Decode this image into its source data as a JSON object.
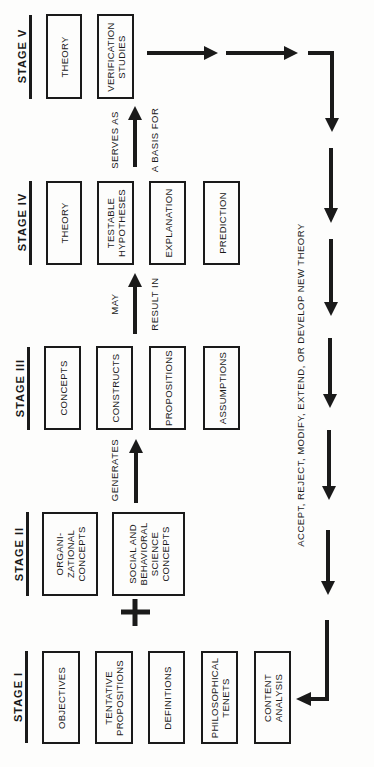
{
  "diagram": {
    "stages": [
      {
        "label": "STAGE V",
        "boxes": [
          "THEORY",
          "VERIFICATION\nSTUDIES"
        ]
      },
      {
        "label": "STAGE IV",
        "boxes": [
          "THEORY",
          "TESTABLE\nHYPOTHESES",
          "EXPLANATION",
          "PREDICTION"
        ]
      },
      {
        "label": "STAGE III",
        "boxes": [
          "CONCEPTS",
          "CONSTRUCTS",
          "PROPOSITIONS",
          "ASSUMPTIONS"
        ]
      },
      {
        "label": "STAGE II",
        "boxes": [
          "ORGANI-\nZATIONAL\nCONCEPTS",
          "SOCIAL AND\nBEHAVIORAL\nSCIENCE\nCONCEPTS"
        ]
      },
      {
        "label": "STAGE I",
        "boxes": [
          "OBJECTIVES",
          "TENTATIVE\nPROPOSITIONS",
          "DEFINITIONS",
          "PHILOSOPHICAL\nTENETS",
          "CONTENT\nANALYSIS"
        ]
      }
    ],
    "connectors": {
      "stage4_to_5": {
        "line1": "SERVES AS",
        "line2": "A BASIS FOR"
      },
      "stage3_to_4": {
        "line1": "MAY",
        "line2": "RESULT IN"
      },
      "stage2_to_3": {
        "line1": "GENERATES"
      },
      "stage1_to_2": {
        "symbol": "+"
      }
    },
    "feedback_label": "ACCEPT, REJECT, MODIFY, EXTEND, OR DEVELOP NEW THEORY",
    "colors": {
      "ink": "#1a1a1a",
      "paper": "#fdfdfc"
    }
  }
}
